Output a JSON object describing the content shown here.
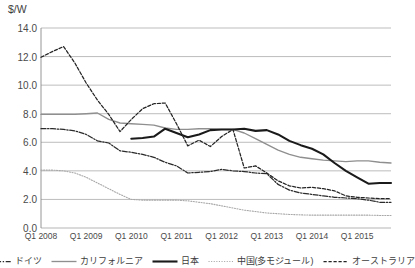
{
  "chart_data": {
    "type": "line",
    "title": "",
    "ylabel": "$/W",
    "xlabel": "",
    "ylim": [
      0.0,
      14.0
    ],
    "yticks": [
      "0.0",
      "2.0",
      "4.0",
      "6.0",
      "8.0",
      "10.0",
      "12.0",
      "14.0"
    ],
    "grid": true,
    "legend_position": "bottom",
    "xtick_labels": [
      "Q1 2008",
      "Q1 2009",
      "Q1 2010",
      "Q1 2011",
      "Q1 2012",
      "Q1 2013",
      "Q1 2014",
      "Q1 2015"
    ],
    "x": [
      "Q1 2008",
      "Q2 2008",
      "Q3 2008",
      "Q4 2008",
      "Q1 2009",
      "Q2 2009",
      "Q3 2009",
      "Q4 2009",
      "Q1 2010",
      "Q2 2010",
      "Q3 2010",
      "Q4 2010",
      "Q1 2011",
      "Q2 2011",
      "Q3 2011",
      "Q4 2011",
      "Q1 2012",
      "Q2 2012",
      "Q3 2012",
      "Q4 2012",
      "Q1 2013",
      "Q2 2013",
      "Q3 2013",
      "Q4 2013",
      "Q1 2014",
      "Q2 2014",
      "Q3 2014",
      "Q4 2014",
      "Q1 2015",
      "Q2 2015",
      "Q3 2015",
      "Q4 2015"
    ],
    "series": [
      {
        "name": "ドイツ",
        "style": "dash-dot",
        "color": "#2b2b2b",
        "values": [
          6.95,
          6.95,
          6.9,
          6.8,
          6.55,
          6.1,
          5.95,
          5.4,
          5.3,
          5.15,
          4.95,
          4.6,
          4.35,
          3.85,
          3.9,
          3.95,
          4.1,
          4.0,
          3.95,
          3.85,
          3.8,
          3.05,
          2.65,
          2.45,
          2.35,
          2.25,
          2.15,
          2.1,
          2.05,
          1.95,
          1.8,
          1.8
        ]
      },
      {
        "name": "カリフォルニア",
        "style": "solid-light",
        "color": "#8f8f8f",
        "values": [
          7.95,
          7.95,
          7.95,
          7.95,
          8.0,
          8.05,
          7.6,
          7.35,
          7.3,
          7.25,
          7.2,
          7.0,
          6.9,
          6.9,
          6.95,
          6.95,
          6.9,
          6.9,
          6.65,
          6.25,
          5.85,
          5.45,
          5.15,
          4.95,
          4.85,
          4.75,
          4.7,
          4.65,
          4.7,
          4.7,
          4.6,
          4.55
        ]
      },
      {
        "name": "日本",
        "style": "solid-bold",
        "color": "#1a1a1a",
        "values": [
          null,
          null,
          null,
          null,
          null,
          null,
          null,
          null,
          6.25,
          6.3,
          6.4,
          6.95,
          6.65,
          6.35,
          6.55,
          6.85,
          6.9,
          6.9,
          6.95,
          6.8,
          6.85,
          6.55,
          6.1,
          5.8,
          5.55,
          5.15,
          4.55,
          4.0,
          3.55,
          3.1,
          3.15,
          3.15
        ]
      },
      {
        "name": "中国(多モジュール)",
        "style": "dotted-fine",
        "color": "#a8a8a8",
        "values": [
          4.05,
          4.05,
          4.0,
          3.85,
          3.55,
          3.15,
          2.75,
          2.35,
          2.0,
          1.95,
          1.95,
          1.95,
          1.95,
          1.9,
          1.8,
          1.7,
          1.55,
          1.4,
          1.25,
          1.15,
          1.05,
          1.0,
          0.95,
          0.92,
          0.9,
          0.9,
          0.9,
          0.9,
          0.9,
          0.9,
          0.88,
          0.88
        ]
      },
      {
        "name": "オーストラリア",
        "style": "dashed",
        "color": "#242424",
        "values": [
          11.95,
          12.35,
          12.7,
          11.55,
          10.15,
          8.95,
          7.95,
          6.75,
          7.6,
          8.35,
          8.7,
          8.75,
          7.3,
          5.75,
          6.15,
          5.7,
          6.4,
          6.9,
          4.2,
          4.35,
          3.85,
          3.3,
          2.95,
          2.8,
          2.85,
          2.75,
          2.6,
          2.25,
          2.15,
          2.1,
          2.05,
          2.05
        ]
      }
    ]
  },
  "axis": {
    "y_unit_label": "$/W"
  },
  "legend": {
    "items": [
      {
        "label": "ドイツ",
        "style": "dash-dot"
      },
      {
        "label": "カリフォルニア",
        "style": "solid-light"
      },
      {
        "label": "日本",
        "style": "solid-bold"
      },
      {
        "label": "中国(多モジュール)",
        "style": "dotted-fine"
      },
      {
        "label": "オーストラリア",
        "style": "dashed"
      }
    ]
  }
}
